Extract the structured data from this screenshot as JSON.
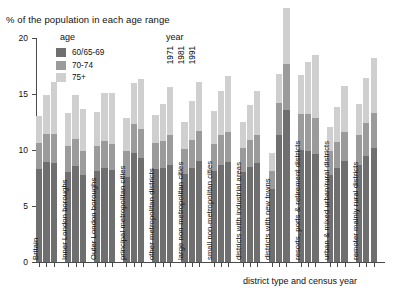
{
  "chart_data": {
    "type": "bar",
    "title": "% of the population in each age range",
    "xlabel": "district type and census year",
    "ylabel": "",
    "ylim": [
      0,
      20
    ],
    "yticks": [
      0,
      5,
      10,
      15,
      20
    ],
    "ytick_labels": [
      "0",
      "5",
      "10",
      "15",
      "20"
    ],
    "grid": false,
    "stacked": true,
    "legend_position": "top-inside",
    "legend_age_title": "age",
    "legend_year_title": "year",
    "series": [
      {
        "name": "60/65-69",
        "color": "#6f6f6f"
      },
      {
        "name": "70-74",
        "color": "#9b9b9b"
      },
      {
        "name": "75+",
        "color": "#cfcfcf"
      }
    ],
    "years": [
      "1971",
      "1981",
      "1991"
    ],
    "categories": [
      "Britain",
      "Inner London boroughs",
      "Outer London boroughs",
      "principal metropolitan cities",
      "other metropolitan districts",
      "large non-metropolitan cities",
      "small non-metropolitan cities",
      "districts with industrial areas",
      "districts with new towns",
      "resorts, ports & retirement districts",
      "urban & mixed urban/rural districts",
      "remoter mainly rural districts"
    ],
    "groups": [
      {
        "category": "Britain",
        "bars": [
          {
            "year": "1971",
            "values": [
              8.3,
              2.3,
              2.4
            ],
            "total": 13.0
          },
          {
            "year": "1981",
            "values": [
              8.9,
              2.5,
              3.5
            ],
            "total": 14.9
          },
          {
            "year": "1991",
            "values": [
              8.8,
              2.6,
              4.7
            ],
            "total": 16.1
          }
        ]
      },
      {
        "category": "Inner London boroughs",
        "bars": [
          {
            "year": "1971",
            "values": [
              8.0,
              2.4,
              2.9
            ],
            "total": 13.3
          },
          {
            "year": "1981",
            "values": [
              8.6,
              2.4,
              3.9
            ],
            "total": 14.9
          },
          {
            "year": "1991",
            "values": [
              7.8,
              2.1,
              3.8
            ],
            "total": 13.7
          }
        ]
      },
      {
        "category": "Outer London boroughs",
        "bars": [
          {
            "year": "1971",
            "values": [
              8.1,
              2.3,
              3.0
            ],
            "total": 13.4
          },
          {
            "year": "1981",
            "values": [
              8.4,
              2.4,
              4.3
            ],
            "total": 15.1
          },
          {
            "year": "1991",
            "values": [
              8.2,
              2.3,
              4.6
            ],
            "total": 15.1
          }
        ]
      },
      {
        "category": "principal metropolitan cities",
        "bars": [
          {
            "year": "1971",
            "values": [
              7.6,
              2.3,
              3.0
            ],
            "total": 12.9
          },
          {
            "year": "1981",
            "values": [
              9.7,
              2.6,
              3.7
            ],
            "total": 16.0
          },
          {
            "year": "1991",
            "values": [
              9.3,
              2.6,
              4.4
            ],
            "total": 16.3
          }
        ]
      },
      {
        "category": "other metropolitan districts",
        "bars": [
          {
            "year": "1971",
            "values": [
              8.3,
              2.3,
              2.5
            ],
            "total": 13.1
          },
          {
            "year": "1981",
            "values": [
              8.4,
              2.4,
              3.3
            ],
            "total": 14.1
          },
          {
            "year": "1991",
            "values": [
              8.7,
              2.6,
              4.3
            ],
            "total": 15.6
          }
        ]
      },
      {
        "category": "large non-metropolitan cities",
        "bars": [
          {
            "year": "1971",
            "values": [
              7.9,
              2.2,
              2.4
            ],
            "total": 12.5
          },
          {
            "year": "1981",
            "values": [
              8.4,
              2.5,
              3.5
            ],
            "total": 14.4
          },
          {
            "year": "1991",
            "values": [
              9.0,
              2.7,
              4.4
            ],
            "total": 16.1
          }
        ]
      },
      {
        "category": "small non-metropolitan cities",
        "bars": [
          {
            "year": "1971",
            "values": [
              8.1,
              2.4,
              3.0
            ],
            "total": 13.5
          },
          {
            "year": "1981",
            "values": [
              8.7,
              2.6,
              4.0
            ],
            "total": 15.3
          },
          {
            "year": "1991",
            "values": [
              8.9,
              2.7,
              5.0
            ],
            "total": 16.6
          }
        ]
      },
      {
        "category": "districts with industrial areas",
        "bars": [
          {
            "year": "1971",
            "values": [
              8.0,
              2.2,
              2.3
            ],
            "total": 12.5
          },
          {
            "year": "1981",
            "values": [
              8.5,
              2.4,
              3.1
            ],
            "total": 14.0
          },
          {
            "year": "1991",
            "values": [
              8.8,
              2.5,
              4.0
            ],
            "total": 15.3
          }
        ]
      },
      {
        "category": "districts with new towns",
        "bars": [
          {
            "year": "1971",
            "values": [
              6.5,
              1.6,
              1.6
            ],
            "total": 9.7
          },
          {
            "year": "1981",
            "values": [
              11.3,
              2.9,
              2.6
            ],
            "total": 16.8
          },
          {
            "year": "1991",
            "values": [
              13.6,
              4.1,
              5.0
            ],
            "total": 22.7
          }
        ]
      },
      {
        "category": "resorts, ports & retirement districts",
        "bars": [
          {
            "year": "1971",
            "values": [
              10.0,
              3.2,
              3.5
            ],
            "total": 16.7
          },
          {
            "year": "1981",
            "values": [
              9.9,
              3.3,
              4.7
            ],
            "total": 17.9
          },
          {
            "year": "1991",
            "values": [
              9.6,
              3.3,
              5.6
            ],
            "total": 18.5
          }
        ]
      },
      {
        "category": "urban & mixed urban/rural districts",
        "bars": [
          {
            "year": "1971",
            "values": [
              7.8,
              2.1,
              2.2
            ],
            "total": 12.1
          },
          {
            "year": "1981",
            "values": [
              8.4,
              2.3,
              3.1
            ],
            "total": 13.8
          },
          {
            "year": "1991",
            "values": [
              9.0,
              2.6,
              4.1
            ],
            "total": 15.7
          }
        ]
      },
      {
        "category": "remoter mainly rural districts",
        "bars": [
          {
            "year": "1971",
            "values": [
              8.7,
              2.6,
              2.8
            ],
            "total": 14.1
          },
          {
            "year": "1981",
            "values": [
              9.5,
              2.9,
              4.0
            ],
            "total": 16.4
          },
          {
            "year": "1991",
            "values": [
              10.2,
              3.1,
              4.9
            ],
            "total": 18.2
          }
        ]
      }
    ]
  }
}
